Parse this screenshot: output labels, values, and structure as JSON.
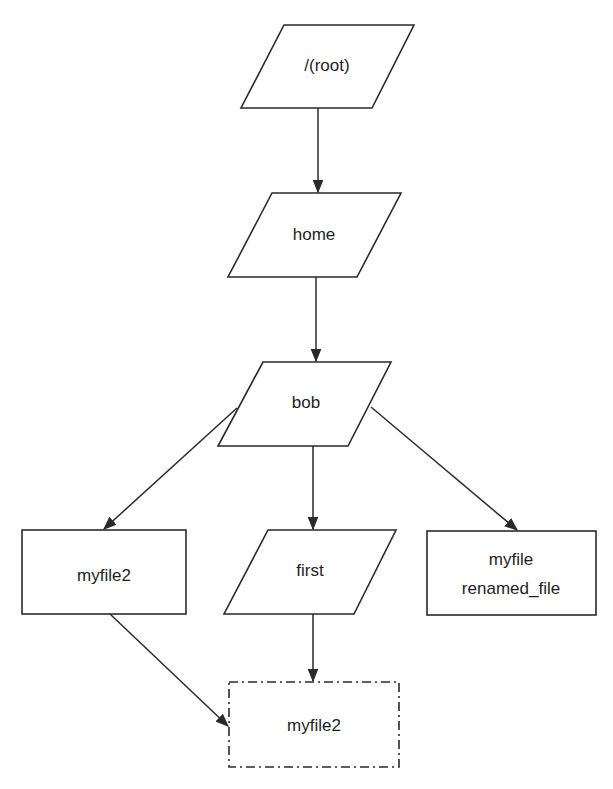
{
  "diagram": {
    "type": "directory-tree-flowchart",
    "nodes": {
      "root": {
        "id": "root",
        "label": "/(root)",
        "shape": "parallelogram"
      },
      "home": {
        "id": "home",
        "label": "home",
        "shape": "parallelogram"
      },
      "bob": {
        "id": "bob",
        "label": "bob",
        "shape": "parallelogram"
      },
      "myfile2": {
        "id": "myfile2",
        "label": "myfile2",
        "shape": "rectangle"
      },
      "first": {
        "id": "first",
        "label": "first",
        "shape": "parallelogram"
      },
      "renamed": {
        "id": "renamed",
        "line1": "myfile",
        "line2": "renamed_file",
        "shape": "rectangle"
      },
      "moved": {
        "id": "moved",
        "label": "myfile2",
        "shape": "rectangle-dash-dot"
      }
    },
    "edges": [
      {
        "from": "root",
        "to": "home"
      },
      {
        "from": "home",
        "to": "bob"
      },
      {
        "from": "bob",
        "to": "myfile2"
      },
      {
        "from": "bob",
        "to": "first"
      },
      {
        "from": "bob",
        "to": "renamed"
      },
      {
        "from": "first",
        "to": "moved"
      },
      {
        "from": "myfile2",
        "to": "moved"
      }
    ],
    "colors": {
      "stroke": "#2a2a2a",
      "text": "#1e1e1e",
      "background": "#ffffff"
    }
  }
}
